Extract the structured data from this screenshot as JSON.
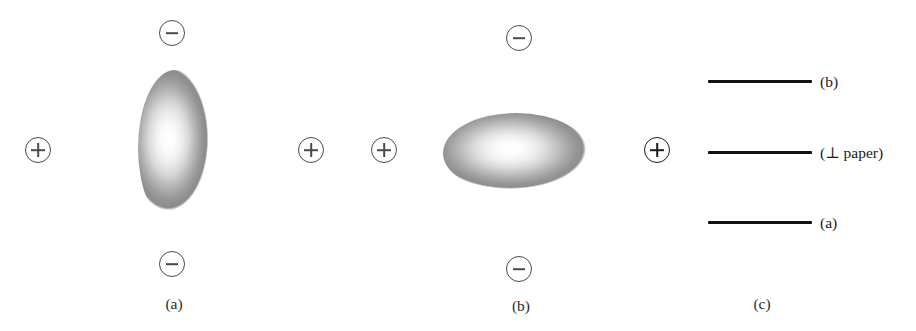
{
  "figure": {
    "panels": [
      {
        "id": "a",
        "caption": "(a)",
        "orbital_orientation": "vertical",
        "charges": [
          {
            "name": "negative-charge-top",
            "symbol": "minus",
            "x": 172,
            "y": 33
          },
          {
            "name": "positive-charge-left",
            "symbol": "plus",
            "x": 38,
            "y": 150
          },
          {
            "name": "positive-charge-right",
            "symbol": "plus",
            "x": 311,
            "y": 150
          },
          {
            "name": "negative-charge-bottom",
            "symbol": "minus",
            "x": 172,
            "y": 264
          }
        ]
      },
      {
        "id": "b",
        "caption": "(b)",
        "orbital_orientation": "horizontal",
        "charges": [
          {
            "name": "negative-charge-top",
            "symbol": "minus",
            "x": 519,
            "y": 38
          },
          {
            "name": "positive-charge-left",
            "symbol": "plus",
            "x": 384,
            "y": 150
          },
          {
            "name": "positive-charge-right",
            "symbol": "plus",
            "x": 657,
            "y": 150
          },
          {
            "name": "negative-charge-bottom",
            "symbol": "minus",
            "x": 519,
            "y": 269
          }
        ]
      },
      {
        "id": "c",
        "caption": "(c)",
        "energy_levels": [
          {
            "name": "level-b",
            "label": "(b)",
            "y": 81
          },
          {
            "name": "level-perp",
            "label": "(⊥ paper)",
            "y": 152
          },
          {
            "name": "level-a",
            "label": "(a)",
            "y": 222
          }
        ]
      }
    ],
    "symbols": {
      "plus": "⊕",
      "minus": "⊖",
      "perpendicular": "⊥"
    },
    "colors": {
      "charge_outline": "#4a4a4a",
      "charge_outline_dark": "#1c1c1c",
      "level_line": "#111111",
      "text": "#1a1a1a",
      "background": "#ffffff"
    }
  }
}
